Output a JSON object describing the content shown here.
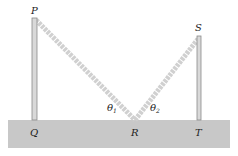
{
  "diagram": {
    "title": "",
    "points": {
      "P": {
        "label": "P",
        "x": 35,
        "y": 18
      },
      "Q": {
        "label": "Q",
        "x": 35,
        "y": 120
      },
      "R": {
        "label": "R",
        "x": 135,
        "y": 120
      },
      "S": {
        "label": "S",
        "x": 199,
        "y": 36
      },
      "T": {
        "label": "T",
        "x": 199,
        "y": 120
      }
    },
    "angles": {
      "theta1": {
        "symbol": "θ",
        "subscript": "1"
      },
      "theta2": {
        "symbol": "θ",
        "subscript": "2"
      }
    },
    "segments": [
      "PR",
      "RS"
    ],
    "poles": [
      "PQ",
      "ST"
    ],
    "colors": {
      "ground": "#c8c8c8",
      "pole_fill": "#d9d9d9",
      "pole_stroke": "#8a8a8a",
      "ray": "#d0d0d0",
      "label": "#222222"
    }
  }
}
